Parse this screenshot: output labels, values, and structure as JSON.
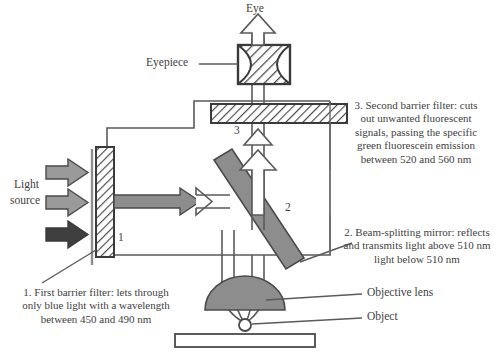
{
  "figure": {
    "type": "fluorescence-microscope-light-path",
    "title_visible": false
  },
  "labels": {
    "eye": "Eye",
    "eyepiece": "Eyepiece",
    "light_source_line1": "Light",
    "light_source_line2": "source",
    "objective_lens": "Objective lens",
    "object": "Object",
    "filter1_number": "1",
    "filter3_number": "3",
    "mirror_number": "2"
  },
  "captions": {
    "filter1": {
      "lines": [
        "1. First barrier filter: lets through",
        "only blue light with a wavelength",
        "between 450 and 490 nm"
      ]
    },
    "mirror2": {
      "lines": [
        "2. Beam-splitting mirror: reflects",
        "and transmits light above 510 nm",
        "light below 510 nm"
      ]
    },
    "filter3": {
      "lines": [
        "3. Second barrier filter: cuts",
        "out unwanted fluorescent",
        "signals, passing the specific",
        "green fluorescein emission",
        "between 520 and 560 nm"
      ]
    }
  },
  "colors": {
    "stroke": "#4a4a4a",
    "dark_stroke": "#3a3a3a",
    "gray_fill": "#8d8d8d",
    "dark_arrow": "#3f3f3f",
    "light_gray_arrow": "#9a9a9a",
    "hatch_line": "#4a4a4a",
    "white": "#ffffff",
    "text": "#414141"
  },
  "wavelengths": {
    "excitation_low_nm": 450,
    "excitation_high_nm": 490,
    "dichroic_cutoff_nm": 510,
    "emission_low_nm": 520,
    "emission_high_nm": 560
  }
}
